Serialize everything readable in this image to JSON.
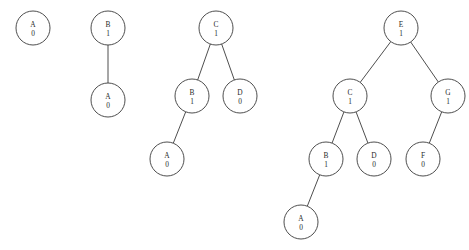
{
  "figure": {
    "name": "binary-tree-insertion-sequence",
    "background_color": "#ffffff",
    "stroke_color": "#3a3a3a",
    "text_color": "#2b2b2b",
    "node_radius": 17
  },
  "trees": [
    {
      "id": "tree-1",
      "nodes": [
        {
          "id": "t1-A",
          "key": "A",
          "value": "0",
          "cx": 33,
          "cy": 28
        }
      ],
      "edges": []
    },
    {
      "id": "tree-2",
      "nodes": [
        {
          "id": "t2-B",
          "key": "B",
          "value": "1",
          "cx": 108,
          "cy": 28
        },
        {
          "id": "t2-A",
          "key": "A",
          "value": "0",
          "cx": 108,
          "cy": 100
        }
      ],
      "edges": [
        {
          "from": "t2-B",
          "to": "t2-A"
        }
      ]
    },
    {
      "id": "tree-3",
      "nodes": [
        {
          "id": "t3-C",
          "key": "C",
          "value": "1",
          "cx": 216,
          "cy": 28
        },
        {
          "id": "t3-B",
          "key": "B",
          "value": "1",
          "cx": 192,
          "cy": 96
        },
        {
          "id": "t3-D",
          "key": "D",
          "value": "0",
          "cx": 240,
          "cy": 96
        },
        {
          "id": "t3-A",
          "key": "A",
          "value": "0",
          "cx": 167,
          "cy": 159
        }
      ],
      "edges": [
        {
          "from": "t3-C",
          "to": "t3-B"
        },
        {
          "from": "t3-C",
          "to": "t3-D"
        },
        {
          "from": "t3-B",
          "to": "t3-A"
        }
      ]
    },
    {
      "id": "tree-4",
      "nodes": [
        {
          "id": "t4-E",
          "key": "E",
          "value": "1",
          "cx": 401,
          "cy": 28
        },
        {
          "id": "t4-C",
          "key": "C",
          "value": "1",
          "cx": 350,
          "cy": 96
        },
        {
          "id": "t4-G",
          "key": "G",
          "value": "1",
          "cx": 448,
          "cy": 96
        },
        {
          "id": "t4-B",
          "key": "B",
          "value": "1",
          "cx": 326,
          "cy": 159
        },
        {
          "id": "t4-D",
          "key": "D",
          "value": "0",
          "cx": 374,
          "cy": 159
        },
        {
          "id": "t4-F",
          "key": "F",
          "value": "0",
          "cx": 423,
          "cy": 159
        },
        {
          "id": "t4-A",
          "key": "A",
          "value": "0",
          "cx": 301,
          "cy": 222
        }
      ],
      "edges": [
        {
          "from": "t4-E",
          "to": "t4-C"
        },
        {
          "from": "t4-E",
          "to": "t4-G"
        },
        {
          "from": "t4-C",
          "to": "t4-B"
        },
        {
          "from": "t4-C",
          "to": "t4-D"
        },
        {
          "from": "t4-G",
          "to": "t4-F"
        },
        {
          "from": "t4-B",
          "to": "t4-A"
        }
      ]
    }
  ]
}
